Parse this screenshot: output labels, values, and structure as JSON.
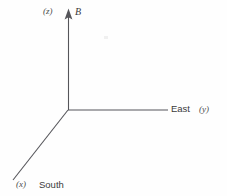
{
  "figure": {
    "background_color": "#fefefe",
    "line_color": "#55555a",
    "text_color": "#3a3a3a",
    "width": 227,
    "height": 196
  },
  "origin": {
    "x": 68,
    "y": 110
  },
  "axes": [
    {
      "name": "vertical-up",
      "symbol": "B",
      "coordinate": "(z)",
      "from": {
        "x": 68,
        "y": 110
      },
      "to": {
        "x": 68,
        "y": 9
      },
      "arrowhead": true,
      "direction": "up"
    },
    {
      "name": "east",
      "symbol": "East",
      "coordinate": "(y)",
      "from": {
        "x": 68,
        "y": 110
      },
      "to": {
        "x": 168,
        "y": 110
      },
      "arrowhead": false,
      "direction": "right"
    },
    {
      "name": "south",
      "symbol": "South",
      "coordinate": "(x)",
      "from": {
        "x": 68,
        "y": 110
      },
      "to": {
        "x": 13,
        "y": 180
      },
      "arrowhead": false,
      "direction": "down-left"
    }
  ],
  "labels": {
    "z_paren": "(z)",
    "b_symbol": "B",
    "east_word": "East",
    "y_paren": "(y)",
    "x_paren": "(x)",
    "south_word": "South"
  }
}
